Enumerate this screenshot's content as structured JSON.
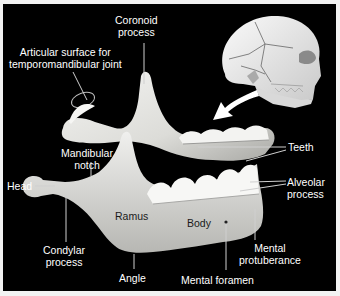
{
  "diagram": {
    "background_color": "#000000",
    "bone_color": "#e9e9e6",
    "label_color": "#ffffff",
    "leader_line_color": "#c8c8c8",
    "inset": "Skull lateral view with arrow pointing to mandible",
    "labels": {
      "coronoid_1": "Coronoid",
      "coronoid_2": "process",
      "articular_1": "Articular surface for",
      "articular_2": "temporomandibular joint",
      "teeth": "Teeth",
      "mandibular_notch_1": "Mandibular",
      "mandibular_notch_2": "notch",
      "head": "Head",
      "alveolar_1": "Alveolar",
      "alveolar_2": "process",
      "ramus": "Ramus",
      "body": "Body",
      "condylar_1": "Condylar",
      "condylar_2": "process",
      "mental_protuberance_1": "Mental",
      "mental_protuberance_2": "protuberance",
      "angle": "Angle",
      "mental_foramen": "Mental foramen"
    }
  }
}
